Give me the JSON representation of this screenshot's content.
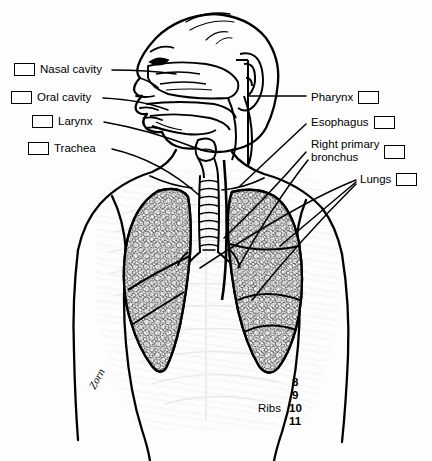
{
  "figure": {
    "background_color": "#fdfdfd",
    "ink_color": "#000000",
    "ghost_color": "#d8d8d8",
    "width": 432,
    "height": 461
  },
  "labels": [
    {
      "id": "nasal-cavity",
      "text": "Nasal cavity",
      "box_side": "left",
      "x": 14,
      "y": 64,
      "box_x": 14,
      "box_y": 67,
      "text_x": 38,
      "text_y": 64
    },
    {
      "id": "oral-cavity",
      "text": "Oral cavity",
      "box_side": "left",
      "x": 11,
      "y": 92,
      "box_x": 11,
      "box_y": 95,
      "text_x": 34,
      "text_y": 92
    },
    {
      "id": "larynx",
      "text": "Larynx",
      "box_side": "left",
      "x": 32,
      "y": 116,
      "box_x": 32,
      "box_y": 119,
      "text_x": 56,
      "text_y": 116
    },
    {
      "id": "trachea",
      "text": "Trachea",
      "box_side": "left",
      "x": 28,
      "y": 143,
      "box_x": 28,
      "box_y": 146,
      "text_x": 52,
      "text_y": 143
    },
    {
      "id": "pharynx",
      "text": "Pharynx",
      "box_side": "right",
      "x": 311,
      "y": 92,
      "box_x": 364,
      "box_y": 95,
      "text_x": 311,
      "text_y": 92
    },
    {
      "id": "esophagus",
      "text": "Esophagus",
      "box_side": "right",
      "x": 311,
      "y": 117,
      "box_x": 374,
      "box_y": 120,
      "text_x": 311,
      "text_y": 117
    },
    {
      "id": "right-primary-bronchus",
      "text": "Right primary\nbronchus",
      "box_side": "right",
      "x": 311,
      "y": 140,
      "box_x": 383,
      "box_y": 146,
      "text_x": 311,
      "text_y": 140
    },
    {
      "id": "lungs",
      "text": "Lungs",
      "box_side": "right",
      "x": 360,
      "y": 174,
      "box_x": 397,
      "box_y": 176,
      "text_x": 360,
      "text_y": 174
    }
  ],
  "ribs": {
    "word": "Ribs",
    "word_x": 258,
    "word_y": 408,
    "numbers": [
      {
        "value": "8",
        "x": 292,
        "y": 382
      },
      {
        "value": "9",
        "x": 292,
        "y": 395
      },
      {
        "value": "10",
        "x": 289,
        "y": 408
      },
      {
        "value": "11",
        "x": 289,
        "y": 421
      }
    ]
  },
  "signature": {
    "text": "Zorn",
    "x": 95,
    "y": 390,
    "rotation": -62
  },
  "anatomy": {
    "parts": [
      "head-profile",
      "nasal-cavity",
      "oral-cavity",
      "tongue",
      "pharynx",
      "larynx",
      "trachea",
      "esophagus",
      "right-primary-bronchus",
      "left-lung",
      "right-lung",
      "torso-outline",
      "shoulders",
      "ribcage-ghost",
      "ear",
      "hair"
    ]
  }
}
